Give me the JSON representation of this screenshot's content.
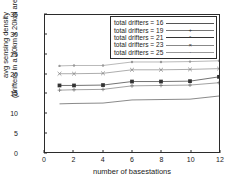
{
  "chart_data": {
    "type": "line",
    "title": "",
    "xlabel": "number of basestations",
    "ylabel_line1": "avg sensing density",
    "ylabel_line2": "(drifters in a 20km x 20km area)",
    "x": [
      1,
      2,
      4,
      6,
      8,
      10,
      12
    ],
    "xlim": [
      0,
      12
    ],
    "ylim": [
      0,
      35
    ],
    "xticks": [
      0,
      2,
      4,
      6,
      8,
      10,
      12
    ],
    "yticks": [
      0,
      5,
      10,
      15,
      20,
      25,
      30,
      35
    ],
    "grid": false,
    "legend_position": "top-right",
    "series": [
      {
        "name": "total drifters = 16",
        "values": [
          12.3,
          12.4,
          12.5,
          13.3,
          13.4,
          13.5,
          14.3
        ],
        "marker": "line",
        "color": "#555555"
      },
      {
        "name": "total drifters = 19",
        "values": [
          15.8,
          15.9,
          16.0,
          16.9,
          17.0,
          17.1,
          17.7
        ],
        "marker": "plus-small",
        "color": "#777777"
      },
      {
        "name": "total drifters = 21",
        "values": [
          17.0,
          17.0,
          17.1,
          18.0,
          18.0,
          18.1,
          19.2
        ],
        "marker": "square",
        "color": "#333333"
      },
      {
        "name": "total drifters = 23",
        "values": [
          20.0,
          20.0,
          20.1,
          21.0,
          21.0,
          21.1,
          21.3
        ],
        "marker": "cross",
        "color": "#888888"
      },
      {
        "name": "total drifters = 25",
        "values": [
          22.0,
          22.1,
          22.1,
          23.0,
          23.0,
          23.1,
          23.3
        ],
        "marker": "dot",
        "color": "#999999"
      }
    ]
  },
  "legend": {
    "entries": [
      {
        "label": "total drifters = 16",
        "glyph": ""
      },
      {
        "label": "total drifters = 19",
        "glyph": "+"
      },
      {
        "label": "total drifters = 21",
        "glyph": "▪"
      },
      {
        "label": "total drifters = 23",
        "glyph": "×"
      },
      {
        "label": "total drifters = 25",
        "glyph": "·"
      }
    ]
  },
  "axes": {
    "x_tick_labels": [
      "0",
      "2",
      "4",
      "6",
      "8",
      "10",
      "12"
    ],
    "y_tick_labels": [
      "0",
      "5",
      "10",
      "15",
      "20",
      "25",
      "30",
      "35"
    ]
  }
}
